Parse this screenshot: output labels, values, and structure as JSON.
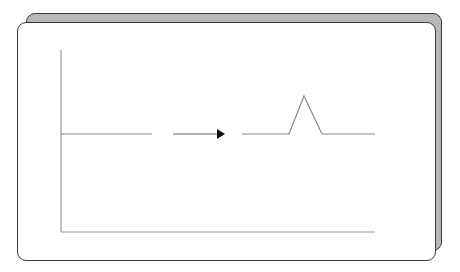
{
  "diagram": {
    "colors": {
      "back_card_fill": "#b8b8b8",
      "card_border": "#3a3a3a",
      "axis": "#9a9a9a",
      "signal": "#8a8a8a",
      "arrow": "#111111"
    },
    "axes": {
      "y_axis": {
        "x": 61,
        "y1": 50,
        "y2": 232
      },
      "x_axis": {
        "y": 232,
        "x1": 61,
        "x2": 375
      }
    },
    "segments": [
      {
        "name": "flat-signal",
        "points": "61,134 152,134"
      },
      {
        "name": "peak-signal",
        "points": "242,134 289,134 304,96 322,134 375,134"
      }
    ],
    "arrow": {
      "x1": 173,
      "x2": 225,
      "y": 134
    }
  }
}
